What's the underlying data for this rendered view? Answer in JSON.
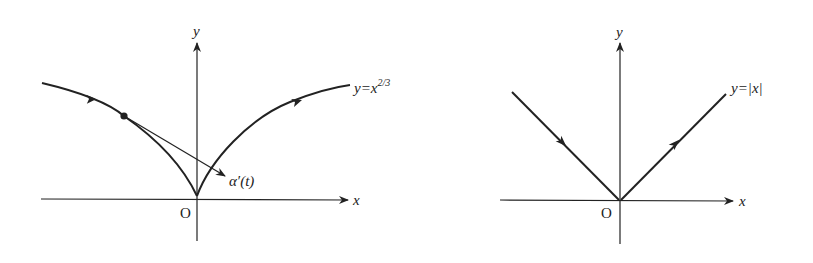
{
  "diagrams": [
    {
      "id": "cusp",
      "axes": {
        "x_label": "x",
        "y_label": "y",
        "origin_label": "O"
      },
      "curve_label": {
        "prefix": "y=x",
        "exponent": "2/3"
      },
      "tangent_label": "α′(t)",
      "description": "Curve y = x^(2/3) with cusp at origin; point on left branch with tangent vector α′(t); arrows show direction of traversal"
    },
    {
      "id": "abs",
      "axes": {
        "x_label": "x",
        "y_label": "y",
        "origin_label": "O"
      },
      "curve_label": "y=|x|",
      "description": "Graph of y = |x| with corner at origin; arrows show direction of traversal"
    }
  ],
  "colors": {
    "ink": "#222222",
    "background": "#ffffff"
  }
}
